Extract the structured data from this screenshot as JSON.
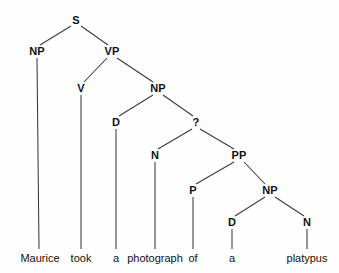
{
  "diagram": {
    "type": "syntax-tree",
    "sentence": "Maurice took a photograph of a platypus",
    "background_color": "#fefefe",
    "line_color": "#3a3a3a",
    "text_color": "#111111",
    "nodes": [
      {
        "id": "S",
        "label": "S",
        "x": 76,
        "y": 20
      },
      {
        "id": "NP1",
        "label": "NP",
        "x": 37,
        "y": 51
      },
      {
        "id": "VP",
        "label": "VP",
        "x": 112,
        "y": 51
      },
      {
        "id": "V",
        "label": "V",
        "x": 81,
        "y": 88
      },
      {
        "id": "NP2",
        "label": "NP",
        "x": 158,
        "y": 88
      },
      {
        "id": "D1",
        "label": "D",
        "x": 116,
        "y": 122
      },
      {
        "id": "QMARK",
        "label": "?",
        "x": 196,
        "y": 122
      },
      {
        "id": "N1",
        "label": "N",
        "x": 155,
        "y": 155
      },
      {
        "id": "PP",
        "label": "PP",
        "x": 239,
        "y": 155
      },
      {
        "id": "P",
        "label": "P",
        "x": 193,
        "y": 190
      },
      {
        "id": "NP3",
        "label": "NP",
        "x": 270,
        "y": 190
      },
      {
        "id": "D2",
        "label": "D",
        "x": 232,
        "y": 222
      },
      {
        "id": "N2",
        "label": "N",
        "x": 307,
        "y": 222
      }
    ],
    "words": [
      {
        "id": "w-maurice",
        "text": "Maurice",
        "x": 40,
        "y": 258,
        "parent": "NP1"
      },
      {
        "id": "w-took",
        "text": "took",
        "x": 81,
        "y": 258,
        "parent": "V"
      },
      {
        "id": "w-a1",
        "text": "a",
        "x": 116,
        "y": 258,
        "parent": "D1"
      },
      {
        "id": "w-photograph",
        "text": "photograph",
        "x": 155,
        "y": 258,
        "parent": "N1"
      },
      {
        "id": "w-of",
        "text": "of",
        "x": 193,
        "y": 258,
        "parent": "P"
      },
      {
        "id": "w-a2",
        "text": "a",
        "x": 232,
        "y": 258,
        "parent": "D2"
      },
      {
        "id": "w-platypus",
        "text": "platypus",
        "x": 307,
        "y": 258,
        "parent": "N2"
      }
    ],
    "edges": [
      {
        "from": "S",
        "to": "NP1",
        "x1": 71,
        "y1": 26,
        "x2": 40,
        "y2": 45
      },
      {
        "from": "S",
        "to": "VP",
        "x1": 81,
        "y1": 26,
        "x2": 108,
        "y2": 45
      },
      {
        "from": "VP",
        "to": "V",
        "x1": 107,
        "y1": 58,
        "x2": 84,
        "y2": 82
      },
      {
        "from": "VP",
        "to": "NP2",
        "x1": 117,
        "y1": 58,
        "x2": 153,
        "y2": 82
      },
      {
        "from": "NP2",
        "to": "D1",
        "x1": 153,
        "y1": 95,
        "x2": 119,
        "y2": 116
      },
      {
        "from": "NP2",
        "to": "QMARK",
        "x1": 163,
        "y1": 95,
        "x2": 193,
        "y2": 116
      },
      {
        "from": "QMARK",
        "to": "N1",
        "x1": 192,
        "y1": 129,
        "x2": 158,
        "y2": 149
      },
      {
        "from": "QMARK",
        "to": "PP",
        "x1": 200,
        "y1": 129,
        "x2": 234,
        "y2": 149
      },
      {
        "from": "PP",
        "to": "P",
        "x1": 234,
        "y1": 162,
        "x2": 196,
        "y2": 184
      },
      {
        "from": "PP",
        "to": "NP3",
        "x1": 244,
        "y1": 162,
        "x2": 265,
        "y2": 184
      },
      {
        "from": "NP3",
        "to": "D2",
        "x1": 265,
        "y1": 197,
        "x2": 235,
        "y2": 216
      },
      {
        "from": "NP3",
        "to": "N2",
        "x1": 275,
        "y1": 197,
        "x2": 304,
        "y2": 216
      },
      {
        "from": "NP1",
        "to": "w-maurice",
        "x1": 37,
        "y1": 58,
        "x2": 39,
        "y2": 249
      },
      {
        "from": "V",
        "to": "w-took",
        "x1": 81,
        "y1": 95,
        "x2": 81,
        "y2": 249
      },
      {
        "from": "D1",
        "to": "w-a1",
        "x1": 116,
        "y1": 129,
        "x2": 116,
        "y2": 249
      },
      {
        "from": "N1",
        "to": "w-photograph",
        "x1": 155,
        "y1": 162,
        "x2": 155,
        "y2": 249
      },
      {
        "from": "P",
        "to": "w-of",
        "x1": 193,
        "y1": 197,
        "x2": 193,
        "y2": 249
      },
      {
        "from": "D2",
        "to": "w-a2",
        "x1": 232,
        "y1": 229,
        "x2": 232,
        "y2": 249
      },
      {
        "from": "N2",
        "to": "w-platypus",
        "x1": 307,
        "y1": 229,
        "x2": 307,
        "y2": 249
      }
    ]
  }
}
